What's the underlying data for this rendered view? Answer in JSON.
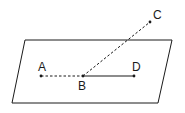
{
  "diagram": {
    "type": "geometry",
    "plane": {
      "shape": "parallelogram",
      "vertices": [
        [
          25,
          40
        ],
        [
          172,
          40
        ],
        [
          158,
          103
        ],
        [
          12,
          103
        ]
      ]
    },
    "points": [
      {
        "label": "A",
        "x": 41,
        "y": 76,
        "label_x": 38,
        "label_y": 71
      },
      {
        "label": "B",
        "x": 83,
        "y": 76,
        "label_x": 78,
        "label_y": 90
      },
      {
        "label": "C",
        "x": 150,
        "y": 22,
        "label_x": 153,
        "label_y": 19
      },
      {
        "label": "D",
        "x": 134,
        "y": 76,
        "label_x": 132,
        "label_y": 71
      }
    ],
    "segments": [
      {
        "from": "A",
        "to": "B",
        "style": "dashed"
      },
      {
        "from": "B",
        "to": "C",
        "style": "dashed"
      },
      {
        "from": "B",
        "to": "D",
        "style": "solid"
      }
    ],
    "colors": {
      "stroke": "#1a1a1a",
      "background": "#ffffff"
    }
  }
}
